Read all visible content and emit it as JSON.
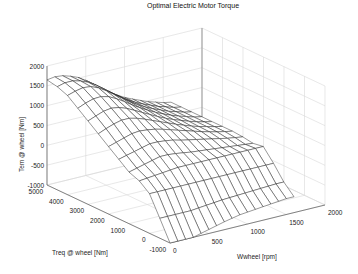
{
  "chart_data": {
    "type": "surface",
    "title": "Optimal Electric Motor Torque",
    "xlabel": "Wwheel [rpm]",
    "ylabel": "Treq @ wheel [Nm]",
    "zlabel": "Tem @ wheel [Nm]",
    "xlim": [
      0,
      2000
    ],
    "ylim": [
      -1000,
      5000
    ],
    "zlim": [
      -1000,
      2000
    ],
    "x_ticks": [
      "0",
      "500",
      "1000",
      "1500",
      "2000"
    ],
    "y_ticks": [
      "-1000",
      "0",
      "1000",
      "2000",
      "3000",
      "4000",
      "5000"
    ],
    "z_ticks": [
      "-1000",
      "-500",
      "0",
      "500",
      "1000",
      "1500",
      "2000"
    ],
    "grid": true,
    "view": "3d-perspective",
    "surface_style": "wireframe mesh, black lines on white",
    "x": [
      0,
      100,
      200,
      300,
      400,
      500,
      600,
      700,
      800,
      900,
      1000,
      1100,
      1200,
      1300,
      1400,
      1500,
      1600
    ],
    "y": [
      -1000,
      -500,
      0,
      500,
      1000,
      1500,
      2000,
      2500,
      3000,
      3500,
      4000,
      4500,
      5000
    ],
    "z": [
      [
        -1000,
        -1000,
        -1000,
        -1000,
        -950,
        -900,
        -850,
        -800,
        -760,
        -720,
        -700,
        -680,
        -660,
        -640,
        -620,
        -600,
        -600
      ],
      [
        -500,
        -500,
        -500,
        -500,
        -500,
        -480,
        -460,
        -440,
        -420,
        -410,
        -400,
        -390,
        -380,
        -370,
        -360,
        -350,
        -350
      ],
      [
        0,
        0,
        0,
        0,
        0,
        0,
        0,
        0,
        0,
        0,
        0,
        0,
        0,
        0,
        0,
        0,
        0
      ],
      [
        200,
        220,
        240,
        260,
        280,
        300,
        300,
        300,
        300,
        300,
        300,
        300,
        300,
        300,
        300,
        300,
        300
      ],
      [
        300,
        350,
        400,
        450,
        500,
        500,
        480,
        450,
        420,
        400,
        380,
        360,
        340,
        320,
        300,
        280,
        260
      ],
      [
        500,
        550,
        600,
        650,
        700,
        700,
        680,
        650,
        600,
        560,
        520,
        480,
        440,
        400,
        360,
        330,
        300
      ],
      [
        700,
        760,
        820,
        880,
        900,
        880,
        850,
        800,
        740,
        680,
        620,
        560,
        500,
        450,
        400,
        360,
        320
      ],
      [
        900,
        980,
        1050,
        1100,
        1100,
        1050,
        980,
        900,
        820,
        740,
        660,
        590,
        520,
        460,
        410,
        360,
        320
      ],
      [
        1100,
        1180,
        1250,
        1280,
        1250,
        1180,
        1080,
        980,
        880,
        780,
        690,
        610,
        540,
        470,
        410,
        360,
        320
      ],
      [
        1300,
        1380,
        1440,
        1450,
        1400,
        1300,
        1180,
        1050,
        930,
        820,
        720,
        630,
        550,
        480,
        420,
        360,
        320
      ],
      [
        1500,
        1560,
        1600,
        1580,
        1500,
        1380,
        1240,
        1100,
        960,
        840,
        730,
        640,
        560,
        480,
        420,
        360,
        320
      ],
      [
        1600,
        1650,
        1650,
        1600,
        1520,
        1400,
        1260,
        1110,
        970,
        840,
        730,
        640,
        560,
        480,
        420,
        360,
        320
      ],
      [
        1650,
        1680,
        1660,
        1600,
        1520,
        1400,
        1260,
        1110,
        970,
        840,
        730,
        640,
        560,
        480,
        420,
        360,
        320
      ]
    ]
  },
  "colors": {
    "background": "#ffffff",
    "axis": "#555555",
    "grid": "#d8d8d8",
    "mesh": "#1a1a1a",
    "face": "#ffffff"
  }
}
